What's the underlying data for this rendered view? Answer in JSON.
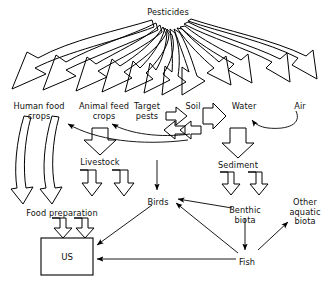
{
  "diagram": {
    "title": "Pesticides",
    "type": "flow-diagram",
    "stroke_color": "#000000",
    "text_color": "#111111",
    "background_color": "#ffffff",
    "nodes": [
      {
        "id": "pesticides",
        "label": "Pesticides",
        "x": 168,
        "y": 8
      },
      {
        "id": "human_food",
        "label": "Human food\ncrops",
        "x": 39,
        "y": 102
      },
      {
        "id": "animal_feed",
        "label": "Animal feed\ncrops",
        "x": 104,
        "y": 102
      },
      {
        "id": "target_pests",
        "label": "Target\npests",
        "x": 147,
        "y": 102
      },
      {
        "id": "soil",
        "label": "Soil",
        "x": 193,
        "y": 102
      },
      {
        "id": "water",
        "label": "Water",
        "x": 244,
        "y": 102
      },
      {
        "id": "air",
        "label": "Air",
        "x": 300,
        "y": 102
      },
      {
        "id": "livestock",
        "label": "Livestock",
        "x": 100,
        "y": 158
      },
      {
        "id": "sediment",
        "label": "Sediment",
        "x": 238,
        "y": 161
      },
      {
        "id": "food_prep",
        "label": "Food preparation",
        "x": 62,
        "y": 209
      },
      {
        "id": "birds",
        "label": "Birds",
        "x": 158,
        "y": 198
      },
      {
        "id": "benthic",
        "label": "Benthic\nbiota",
        "x": 245,
        "y": 206
      },
      {
        "id": "other_aquatic",
        "label": "Other\naquatic\nbiota",
        "x": 305,
        "y": 198
      },
      {
        "id": "fish",
        "label": "Fish",
        "x": 247,
        "y": 258
      },
      {
        "id": "us",
        "label": "US",
        "x": 67,
        "y": 256
      }
    ],
    "us_box": {
      "x": 41,
      "y": 238,
      "width": 52,
      "height": 37
    },
    "edges": [
      {
        "from": "pesticides",
        "to": "human_food",
        "style": "block-curved"
      },
      {
        "from": "pesticides",
        "to": "human_food",
        "style": "block-curved"
      },
      {
        "from": "pesticides",
        "to": "animal_feed",
        "style": "block-curved"
      },
      {
        "from": "pesticides",
        "to": "animal_feed",
        "style": "block-curved"
      },
      {
        "from": "pesticides",
        "to": "target_pests",
        "style": "block-curved"
      },
      {
        "from": "pesticides",
        "to": "target_pests",
        "style": "block-curved"
      },
      {
        "from": "pesticides",
        "to": "soil",
        "style": "block-curved"
      },
      {
        "from": "pesticides",
        "to": "soil",
        "style": "block-curved"
      },
      {
        "from": "pesticides",
        "to": "water",
        "style": "block-curved"
      },
      {
        "from": "pesticides",
        "to": "water",
        "style": "block-curved"
      },
      {
        "from": "pesticides",
        "to": "air",
        "style": "block-curved"
      },
      {
        "from": "pesticides",
        "to": "air",
        "style": "block-curved"
      },
      {
        "from": "target_pests",
        "to": "soil",
        "style": "block-bidirectional"
      },
      {
        "from": "soil",
        "to": "water",
        "style": "block-bidirectional"
      },
      {
        "from": "air",
        "to": "water",
        "style": "thin-curved"
      },
      {
        "from": "soil",
        "to": "animal_feed",
        "style": "thin-curved"
      },
      {
        "from": "soil",
        "to": "human_food",
        "style": "thin-curved"
      },
      {
        "from": "animal_feed",
        "to": "livestock",
        "style": "block"
      },
      {
        "from": "livestock",
        "to": "food_prep",
        "style": "block"
      },
      {
        "from": "human_food",
        "to": "food_prep",
        "style": "block-curved"
      },
      {
        "from": "food_prep",
        "to": "us",
        "style": "block"
      },
      {
        "from": "water",
        "to": "sediment",
        "style": "block"
      },
      {
        "from": "sediment",
        "to": "benthic",
        "style": "block"
      },
      {
        "from": "soil",
        "to": "birds",
        "style": "thin"
      },
      {
        "from": "benthic",
        "to": "birds",
        "style": "thin"
      },
      {
        "from": "benthic",
        "to": "fish",
        "style": "thin"
      },
      {
        "from": "fish",
        "to": "birds",
        "style": "thin"
      },
      {
        "from": "fish",
        "to": "other_aquatic",
        "style": "thin"
      },
      {
        "from": "fish",
        "to": "us",
        "style": "thin"
      },
      {
        "from": "birds",
        "to": "us",
        "style": "thin"
      }
    ]
  }
}
